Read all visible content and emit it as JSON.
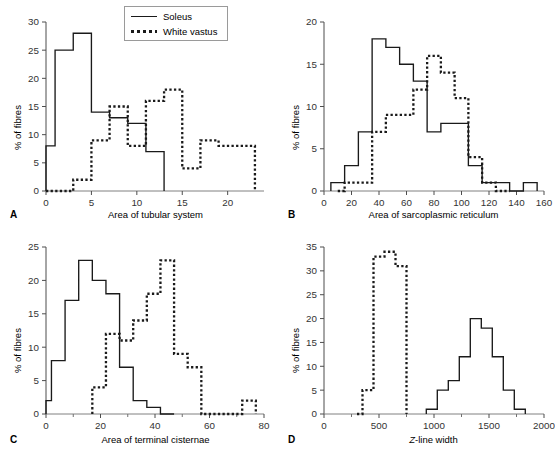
{
  "figure": {
    "legend": {
      "entries": [
        {
          "label": "Soleus",
          "style": "solid",
          "color": "#1a1a1a"
        },
        {
          "label": "White vastus",
          "style": "dotted",
          "color": "#1a1a1a"
        }
      ]
    },
    "panels": [
      {
        "letter": "A",
        "xlabel": "Area of tubular system",
        "ylabel": "% of fibres"
      },
      {
        "letter": "B",
        "xlabel": "Area of sarcoplasmic reticulum",
        "ylabel": "% of fibres"
      },
      {
        "letter": "C",
        "xlabel": "Area of terminal cisternae",
        "ylabel": "% of fibres"
      },
      {
        "letter": "D",
        "xlabel": "Z-line width",
        "ylabel": "% of fibres",
        "xlabel_italic_prefix": "Z"
      }
    ]
  },
  "chart_data": [
    {
      "panel": "A",
      "type": "line",
      "title": "",
      "xlabel": "Area of tubular system",
      "ylabel": "% of fibres",
      "xlim": [
        0,
        24
      ],
      "ylim": [
        0,
        30
      ],
      "xticks": [
        0,
        5,
        10,
        15,
        20
      ],
      "yticks": [
        0,
        5,
        10,
        15,
        20,
        25,
        30
      ],
      "grid": false,
      "legend_position": "top-center",
      "bin_width": 2,
      "series": [
        {
          "name": "Soleus",
          "style": "solid",
          "bin_edges": [
            0,
            1,
            3,
            5,
            7,
            9,
            11,
            13
          ],
          "values": [
            8,
            25,
            28,
            14,
            13,
            12,
            7,
            0
          ]
        },
        {
          "name": "White vastus",
          "style": "dotted",
          "bin_edges": [
            0,
            3,
            5,
            7,
            9,
            11,
            13,
            15,
            17,
            19,
            23
          ],
          "values": [
            0,
            2,
            9,
            15,
            8,
            16,
            18,
            4,
            9,
            8,
            0
          ]
        }
      ]
    },
    {
      "panel": "B",
      "type": "line",
      "title": "",
      "xlabel": "Area of sarcoplasmic reticulum",
      "ylabel": "% of fibres",
      "xlim": [
        0,
        160
      ],
      "ylim": [
        0,
        20
      ],
      "xticks": [
        0,
        20,
        40,
        60,
        80,
        100,
        120,
        140,
        160
      ],
      "yticks": [
        0,
        5,
        10,
        15,
        20
      ],
      "grid": false,
      "bin_width": 10,
      "series": [
        {
          "name": "Soleus",
          "style": "solid",
          "bin_edges": [
            5,
            15,
            25,
            35,
            45,
            55,
            65,
            75,
            85,
            95,
            105,
            115,
            125,
            135,
            145,
            155
          ],
          "values": [
            1,
            3,
            7,
            18,
            17,
            15,
            13,
            7,
            8,
            8,
            3,
            1,
            1,
            0,
            1,
            0
          ]
        },
        {
          "name": "White vastus",
          "style": "dotted",
          "bin_edges": [
            10,
            15,
            35,
            45,
            55,
            65,
            75,
            85,
            95,
            105,
            115,
            125,
            135
          ],
          "values": [
            0,
            1,
            7,
            9,
            9,
            12,
            16,
            14,
            11,
            4,
            1,
            0,
            0
          ]
        }
      ]
    },
    {
      "panel": "C",
      "type": "line",
      "title": "",
      "xlabel": "Area of terminal cisternae",
      "ylabel": "% of fibres",
      "xlim": [
        0,
        80
      ],
      "ylim": [
        0,
        25
      ],
      "xticks": [
        0,
        20,
        40,
        60,
        80
      ],
      "yticks": [
        0,
        5,
        10,
        15,
        20,
        25
      ],
      "grid": false,
      "bin_width": 5,
      "series": [
        {
          "name": "Soleus",
          "style": "solid",
          "bin_edges": [
            0,
            2,
            7,
            12,
            17,
            22,
            27,
            32,
            37,
            42,
            47
          ],
          "values": [
            2,
            8,
            17,
            23,
            20,
            18,
            7,
            2,
            1,
            0,
            0
          ]
        },
        {
          "name": "White vastus",
          "style": "dotted",
          "bin_edges": [
            17,
            22,
            27,
            32,
            37,
            42,
            47,
            52,
            57,
            72,
            77
          ],
          "values": [
            4,
            12,
            11,
            14,
            18,
            23,
            9,
            7,
            0,
            2,
            0
          ]
        }
      ]
    },
    {
      "panel": "D",
      "type": "line",
      "title": "",
      "xlabel": "Z-line width",
      "ylabel": "% of fibres",
      "xlim": [
        0,
        2000
      ],
      "ylim": [
        0,
        35
      ],
      "xticks": [
        0,
        500,
        1000,
        1500,
        2000
      ],
      "yticks": [
        0,
        5,
        10,
        15,
        20,
        25,
        30,
        35
      ],
      "grid": false,
      "bin_width": 100,
      "series": [
        {
          "name": "Soleus",
          "style": "solid",
          "bin_edges": [
            930,
            1030,
            1130,
            1230,
            1330,
            1430,
            1530,
            1630,
            1730,
            1830
          ],
          "values": [
            1,
            5,
            7,
            12,
            20,
            18,
            12,
            5,
            1,
            0
          ]
        },
        {
          "name": "White vastus",
          "style": "dotted",
          "bin_edges": [
            300,
            350,
            450,
            550,
            650,
            750
          ],
          "values": [
            0,
            5,
            33,
            34,
            31,
            0
          ]
        }
      ]
    }
  ]
}
